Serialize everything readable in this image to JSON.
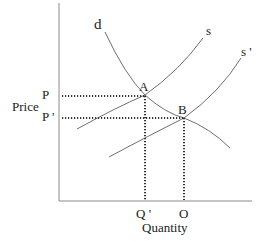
{
  "diagram": {
    "type": "supply-demand",
    "axes": {
      "y_label": "Price",
      "x_label": "Quantity",
      "color": "#8a8a8a"
    },
    "curves": {
      "demand": {
        "label": "d",
        "color": "#6e6e6e"
      },
      "supply": {
        "label": "s",
        "color": "#6e6e6e"
      },
      "supply_shifted": {
        "label": "s '",
        "color": "#6e6e6e"
      }
    },
    "points": {
      "a": {
        "label": "A"
      },
      "b": {
        "label": "B"
      }
    },
    "price_ticks": {
      "p": "P",
      "p_prime": "P '"
    },
    "quantity_ticks": {
      "q_prime": "Q '",
      "o": "O"
    },
    "guide_color": "#333333"
  }
}
